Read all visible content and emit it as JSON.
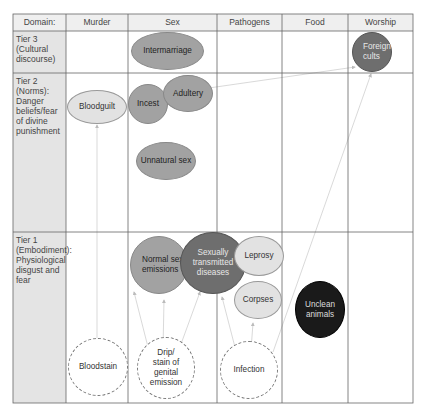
{
  "header": {
    "domain_label": "Domain:",
    "columns": [
      "Murder",
      "Sex",
      "Pathogens",
      "Food",
      "Worship"
    ]
  },
  "tiers": [
    {
      "label": "Tier 3 (Cultural discourse)"
    },
    {
      "label": "Tier 2 (Norms): Danger beliefs/fear of divine punishment"
    },
    {
      "label": "Tier 1 (Embodiment): Physiological disgust and fear"
    }
  ],
  "nodes": {
    "intermarriage": "Intermarriage",
    "foreign_cults": "Foreign cults",
    "bloodguilt": "Bloodguilt",
    "incest": "Incest",
    "adultery": "Adultery",
    "unnatural_sex": "Unnatural sex",
    "normal_sex": "Normal sex, emissions",
    "std": "Sexually transmitted diseases",
    "leprosy": "Leprosy",
    "corpses": "Corpses",
    "unclean_animals": "Unclean animals",
    "bloodstain": "Bloodstain",
    "drip": "Drip/ stain of genital emission",
    "infection": "Infection"
  },
  "colors": {
    "grid": "#555555",
    "label_column_bg": "#e4e4e4",
    "header_bg": "#efefef",
    "arrow": "#cccccc"
  }
}
